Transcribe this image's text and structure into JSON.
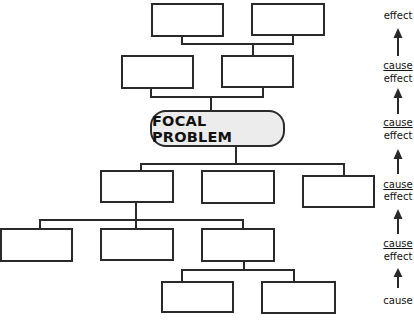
{
  "diagram": {
    "focal_problem": "FOCAL PROBLEM",
    "boxes": {
      "effect_top_left": "",
      "effect_top_right": "",
      "effect_mid_left": "",
      "effect_mid_right": "",
      "cause_1_left": "",
      "cause_1_center": "",
      "cause_1_right": "",
      "cause_2_left": "",
      "cause_2_center": "",
      "cause_2_right": "",
      "cause_3_left": "",
      "cause_3_right": ""
    },
    "side_labels": {
      "level1_effect": "effect",
      "level2_cause": "cause",
      "level2_effect": "effect",
      "level3_cause": "cause",
      "level3_effect": "effect",
      "level4_cause": "cause",
      "level4_effect": "effect",
      "level5_cause": "cause",
      "level5_effect": "effect",
      "level6_cause": "cause"
    },
    "colors": {
      "stroke": "#2a2a2a",
      "focal_fill": "#ececec",
      "background": "#ffffff"
    }
  }
}
